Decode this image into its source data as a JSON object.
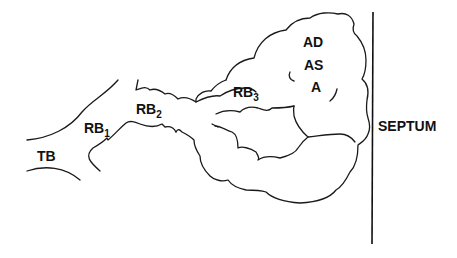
{
  "diagram": {
    "type": "anatomical schematic",
    "labels": {
      "tb": "TB",
      "rb1": {
        "base": "RB",
        "sub": "1"
      },
      "rb2": {
        "base": "RB",
        "sub": "2"
      },
      "rb3": {
        "base": "RB",
        "sub": "3"
      },
      "ad": "AD",
      "as": "AS",
      "a": "A",
      "septum": "SEPTUM"
    },
    "colors": {
      "line": "#1a1a1a",
      "background": "#ffffff"
    }
  }
}
